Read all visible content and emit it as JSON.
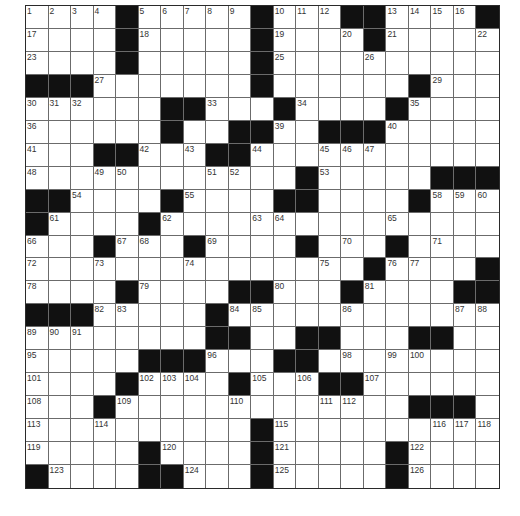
{
  "puzzle": {
    "rows": 21,
    "cols": 21,
    "colors": {
      "black_square": "#111111",
      "white_square": "#ffffff",
      "grid_line": "#6b6b6b",
      "number_text": "#333333"
    },
    "grid": [
      "....#.....#...##....#",
      "....#.....#....#.....",
      "....#.....#..........",
      "###.......#......#...",
      "......##...#....#....",
      "......#..##..###.....",
      "...##...##...........",
      "............#.....###",
      "##....#....##....#...",
      "#....#...............",
      "...#...#....#...#....",
      "...............#....#",
      "....#....##...#....##",
      "###.....#............",
      "........##..##...##..",
      ".....###...##........",
      "....#....#...##......",
      "...#.............###.",
      "..........#..........",
      ".....#....#.....#....",
      "#....##...#.....#...."
    ],
    "numbers": [
      {
        "r": 0,
        "c": 0,
        "n": 1
      },
      {
        "r": 0,
        "c": 1,
        "n": 2
      },
      {
        "r": 0,
        "c": 2,
        "n": 3
      },
      {
        "r": 0,
        "c": 3,
        "n": 4
      },
      {
        "r": 0,
        "c": 5,
        "n": 5
      },
      {
        "r": 0,
        "c": 6,
        "n": 6
      },
      {
        "r": 0,
        "c": 7,
        "n": 7
      },
      {
        "r": 0,
        "c": 8,
        "n": 8
      },
      {
        "r": 0,
        "c": 9,
        "n": 9
      },
      {
        "r": 0,
        "c": 11,
        "n": 10
      },
      {
        "r": 0,
        "c": 12,
        "n": 11
      },
      {
        "r": 0,
        "c": 13,
        "n": 12
      },
      {
        "r": 0,
        "c": 16,
        "n": 13
      },
      {
        "r": 0,
        "c": 17,
        "n": 14
      },
      {
        "r": 0,
        "c": 18,
        "n": 15
      },
      {
        "r": 0,
        "c": 19,
        "n": 16
      },
      {
        "r": 1,
        "c": 0,
        "n": 17
      },
      {
        "r": 1,
        "c": 5,
        "n": 18
      },
      {
        "r": 1,
        "c": 11,
        "n": 19
      },
      {
        "r": 1,
        "c": 14,
        "n": 20
      },
      {
        "r": 1,
        "c": 16,
        "n": 21
      },
      {
        "r": 1,
        "c": 20,
        "n": 22
      },
      {
        "r": 2,
        "c": 0,
        "n": 23
      },
      {
        "r": 2,
        "c": 4,
        "n": 24
      },
      {
        "r": 2,
        "c": 11,
        "n": 25
      },
      {
        "r": 2,
        "c": 15,
        "n": 26
      },
      {
        "r": 3,
        "c": 3,
        "n": 27
      },
      {
        "r": 3,
        "c": 10,
        "n": 28
      },
      {
        "r": 3,
        "c": 18,
        "n": 29
      },
      {
        "r": 4,
        "c": 0,
        "n": 30
      },
      {
        "r": 4,
        "c": 1,
        "n": 31
      },
      {
        "r": 4,
        "c": 2,
        "n": 32
      },
      {
        "r": 4,
        "c": 8,
        "n": 33
      },
      {
        "r": 4,
        "c": 12,
        "n": 34
      },
      {
        "r": 4,
        "c": 17,
        "n": 35
      },
      {
        "r": 5,
        "c": 0,
        "n": 36
      },
      {
        "r": 5,
        "c": 6,
        "n": 37
      },
      {
        "r": 5,
        "c": 9,
        "n": 38
      },
      {
        "r": 5,
        "c": 11,
        "n": 39
      },
      {
        "r": 5,
        "c": 16,
        "n": 40
      },
      {
        "r": 6,
        "c": 0,
        "n": 41
      },
      {
        "r": 6,
        "c": 5,
        "n": 42
      },
      {
        "r": 6,
        "c": 7,
        "n": 43
      },
      {
        "r": 6,
        "c": 10,
        "n": 44
      },
      {
        "r": 6,
        "c": 13,
        "n": 45
      },
      {
        "r": 6,
        "c": 14,
        "n": 46
      },
      {
        "r": 6,
        "c": 15,
        "n": 47
      },
      {
        "r": 7,
        "c": 0,
        "n": 48
      },
      {
        "r": 7,
        "c": 3,
        "n": 49
      },
      {
        "r": 7,
        "c": 4,
        "n": 50
      },
      {
        "r": 7,
        "c": 8,
        "n": 51
      },
      {
        "r": 7,
        "c": 9,
        "n": 52
      },
      {
        "r": 7,
        "c": 13,
        "n": 53
      },
      {
        "r": 8,
        "c": 2,
        "n": 54
      },
      {
        "r": 8,
        "c": 7,
        "n": 55
      },
      {
        "r": 8,
        "c": 12,
        "n": 56
      },
      {
        "r": 8,
        "c": 17,
        "n": 57
      },
      {
        "r": 8,
        "c": 18,
        "n": 58
      },
      {
        "r": 8,
        "c": 19,
        "n": 59
      },
      {
        "r": 8,
        "c": 20,
        "n": 60
      },
      {
        "r": 9,
        "c": 1,
        "n": 61
      },
      {
        "r": 9,
        "c": 6,
        "n": 62
      },
      {
        "r": 9,
        "c": 10,
        "n": 63
      },
      {
        "r": 9,
        "c": 11,
        "n": 64
      },
      {
        "r": 9,
        "c": 16,
        "n": 65
      },
      {
        "r": 10,
        "c": 0,
        "n": 66
      },
      {
        "r": 10,
        "c": 4,
        "n": 67
      },
      {
        "r": 10,
        "c": 5,
        "n": 68
      },
      {
        "r": 10,
        "c": 8,
        "n": 69
      },
      {
        "r": 10,
        "c": 14,
        "n": 70
      },
      {
        "r": 10,
        "c": 18,
        "n": 71
      },
      {
        "r": 11,
        "c": 0,
        "n": 72
      },
      {
        "r": 11,
        "c": 3,
        "n": 73
      },
      {
        "r": 11,
        "c": 7,
        "n": 74
      },
      {
        "r": 11,
        "c": 13,
        "n": 75
      },
      {
        "r": 11,
        "c": 16,
        "n": 76
      },
      {
        "r": 11,
        "c": 17,
        "n": 77
      },
      {
        "r": 12,
        "c": 0,
        "n": 78
      },
      {
        "r": 12,
        "c": 5,
        "n": 79
      },
      {
        "r": 12,
        "c": 11,
        "n": 80
      },
      {
        "r": 12,
        "c": 15,
        "n": 81
      },
      {
        "r": 13,
        "c": 3,
        "n": 82
      },
      {
        "r": 13,
        "c": 4,
        "n": 83
      },
      {
        "r": 13,
        "c": 9,
        "n": 84
      },
      {
        "r": 13,
        "c": 10,
        "n": 85
      },
      {
        "r": 13,
        "c": 14,
        "n": 86
      },
      {
        "r": 13,
        "c": 19,
        "n": 87
      },
      {
        "r": 13,
        "c": 20,
        "n": 88
      },
      {
        "r": 14,
        "c": 0,
        "n": 89
      },
      {
        "r": 14,
        "c": 1,
        "n": 90
      },
      {
        "r": 14,
        "c": 2,
        "n": 91
      },
      {
        "r": 14,
        "c": 8,
        "n": 92
      },
      {
        "r": 14,
        "c": 13,
        "n": 93
      },
      {
        "r": 14,
        "c": 18,
        "n": 94
      },
      {
        "r": 15,
        "c": 0,
        "n": 95
      },
      {
        "r": 15,
        "c": 8,
        "n": 96
      },
      {
        "r": 15,
        "c": 11,
        "n": 97
      },
      {
        "r": 15,
        "c": 14,
        "n": 98
      },
      {
        "r": 15,
        "c": 16,
        "n": 99
      },
      {
        "r": 15,
        "c": 17,
        "n": 100
      },
      {
        "r": 16,
        "c": 0,
        "n": 101
      },
      {
        "r": 16,
        "c": 5,
        "n": 102
      },
      {
        "r": 16,
        "c": 6,
        "n": 103
      },
      {
        "r": 16,
        "c": 7,
        "n": 104
      },
      {
        "r": 16,
        "c": 10,
        "n": 105
      },
      {
        "r": 16,
        "c": 12,
        "n": 106
      },
      {
        "r": 16,
        "c": 15,
        "n": 107
      },
      {
        "r": 17,
        "c": 0,
        "n": 108
      },
      {
        "r": 17,
        "c": 4,
        "n": 109
      },
      {
        "r": 17,
        "c": 9,
        "n": 110
      },
      {
        "r": 17,
        "c": 13,
        "n": 111
      },
      {
        "r": 17,
        "c": 14,
        "n": 112
      },
      {
        "r": 18,
        "c": 0,
        "n": 113
      },
      {
        "r": 18,
        "c": 3,
        "n": 114
      },
      {
        "r": 18,
        "c": 11,
        "n": 115
      },
      {
        "r": 18,
        "c": 18,
        "n": 116
      },
      {
        "r": 18,
        "c": 19,
        "n": 117
      },
      {
        "r": 18,
        "c": 20,
        "n": 118
      },
      {
        "r": 19,
        "c": 0,
        "n": 119
      },
      {
        "r": 19,
        "c": 6,
        "n": 120
      },
      {
        "r": 19,
        "c": 11,
        "n": 121
      },
      {
        "r": 19,
        "c": 17,
        "n": 122
      },
      {
        "r": 20,
        "c": 1,
        "n": 123
      },
      {
        "r": 20,
        "c": 7,
        "n": 124
      },
      {
        "r": 20,
        "c": 11,
        "n": 125
      },
      {
        "r": 20,
        "c": 17,
        "n": 126
      }
    ]
  }
}
